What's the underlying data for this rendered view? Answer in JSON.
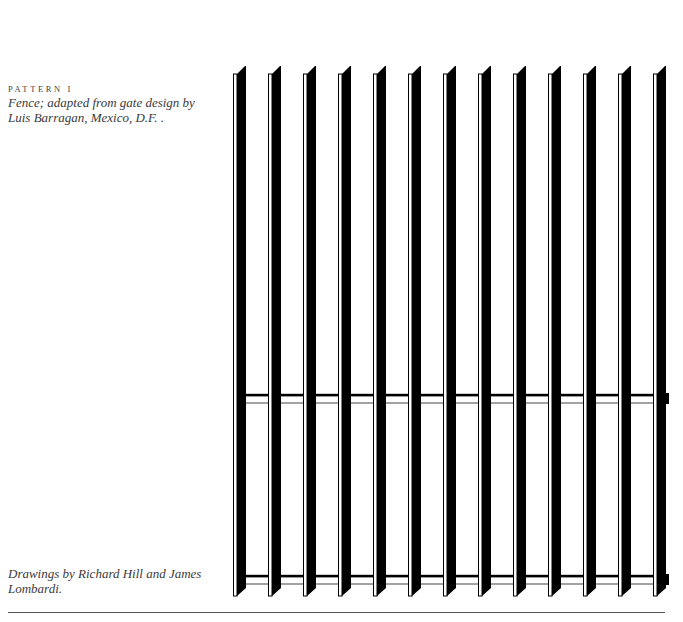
{
  "caption": {
    "title": "PATTERN I",
    "lines": [
      "Fence; adapted from gate design by",
      "Luis Barragan, Mexico, D.F. ."
    ]
  },
  "credit": {
    "lines": [
      "Drawings by Richard Hill and James",
      "Lombardi."
    ]
  },
  "illustration": {
    "subject": "fence-elevation",
    "picket_count": 13,
    "crossbar_count": 2,
    "ink_color": "#000000",
    "paper_color": "#ffffff"
  }
}
